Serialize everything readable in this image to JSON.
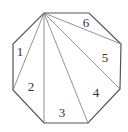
{
  "diagram": {
    "type": "octagon-triangulation",
    "stroke_color": "#555555",
    "inner_stroke_color": "#777777",
    "vertices": [
      [
        44,
        13
      ],
      [
        89,
        13
      ],
      [
        121,
        44
      ],
      [
        120,
        89
      ],
      [
        88,
        123
      ],
      [
        44,
        123
      ],
      [
        13,
        90
      ],
      [
        13,
        44
      ]
    ],
    "apex_index": 0,
    "diagonals_to": [
      2,
      3,
      4,
      5,
      6
    ],
    "regions": [
      {
        "label": "1",
        "x": 20,
        "y": 51
      },
      {
        "label": "2",
        "x": 31,
        "y": 86
      },
      {
        "label": "3",
        "x": 62,
        "y": 112
      },
      {
        "label": "4",
        "x": 96,
        "y": 92
      },
      {
        "label": "5",
        "x": 105,
        "y": 57
      },
      {
        "label": "6",
        "x": 86,
        "y": 22
      }
    ]
  }
}
